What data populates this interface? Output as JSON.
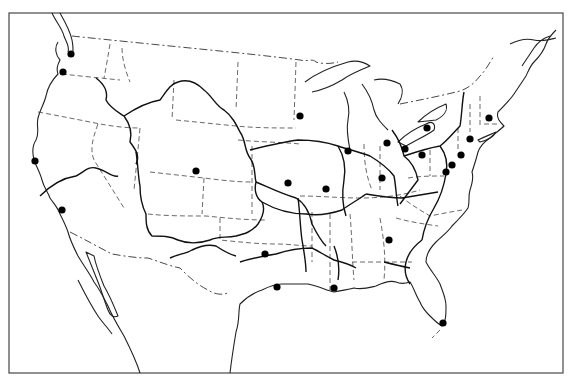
{
  "map": {
    "width": 573,
    "height": 383,
    "frame": {
      "x": 9,
      "y": 13,
      "w": 554,
      "h": 360
    },
    "colors": {
      "background": "#ffffff",
      "lines": "#222222",
      "dots": "#000000"
    },
    "legend": null,
    "cities": [
      {
        "id": "seattle",
        "x": 71,
        "y": 54
      },
      {
        "id": "portland",
        "x": 63,
        "y": 72
      },
      {
        "id": "san-francisco",
        "x": 35,
        "y": 161
      },
      {
        "id": "los-angeles",
        "x": 62,
        "y": 210
      },
      {
        "id": "denver",
        "x": 196,
        "y": 171
      },
      {
        "id": "minneapolis",
        "x": 300,
        "y": 116
      },
      {
        "id": "chicago",
        "x": 348,
        "y": 151
      },
      {
        "id": "detroit",
        "x": 387,
        "y": 143
      },
      {
        "id": "cleveland",
        "x": 405,
        "y": 149
      },
      {
        "id": "buffalo",
        "x": 427,
        "y": 128
      },
      {
        "id": "pittsburgh",
        "x": 422,
        "y": 155
      },
      {
        "id": "boston",
        "x": 489,
        "y": 118
      },
      {
        "id": "new-york",
        "x": 470,
        "y": 139
      },
      {
        "id": "philadelphia",
        "x": 461,
        "y": 155
      },
      {
        "id": "baltimore",
        "x": 452,
        "y": 165
      },
      {
        "id": "washington",
        "x": 446,
        "y": 172
      },
      {
        "id": "kansas-city",
        "x": 288,
        "y": 183
      },
      {
        "id": "st-louis",
        "x": 326,
        "y": 189
      },
      {
        "id": "cincinnati",
        "x": 382,
        "y": 178
      },
      {
        "id": "atlanta",
        "x": 389,
        "y": 240
      },
      {
        "id": "dallas",
        "x": 265,
        "y": 254
      },
      {
        "id": "houston",
        "x": 277,
        "y": 287
      },
      {
        "id": "new-orleans",
        "x": 334,
        "y": 288
      },
      {
        "id": "miami",
        "x": 443,
        "y": 323
      }
    ]
  }
}
